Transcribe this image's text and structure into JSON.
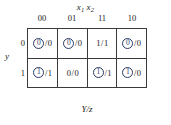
{
  "figure": {
    "top_input_label": "x1x2",
    "top_input_base": "x",
    "top_input_sub1": "1",
    "top_input_sub2": "2",
    "row_state_label": "y",
    "bottom_output_label": "Y/z",
    "slash": "/",
    "circle_color": "#2b3a66",
    "line_color": "#3a3a3a"
  },
  "chart_data": {
    "type": "table",
    "xlabel": "x1x2",
    "ylabel": "y",
    "footer_label": "Y/z",
    "column_headers": [
      "00",
      "01",
      "11",
      "10"
    ],
    "row_headers": [
      "0",
      "1"
    ],
    "cells": [
      [
        {
          "next_state": "0",
          "output": "0",
          "stable": true
        },
        {
          "next_state": "0",
          "output": "0",
          "stable": true
        },
        {
          "next_state": "1",
          "output": "1",
          "stable": false
        },
        {
          "next_state": "0",
          "output": "0",
          "stable": true
        }
      ],
      [
        {
          "next_state": "1",
          "output": "1",
          "stable": true
        },
        {
          "next_state": "0",
          "output": "0",
          "stable": false
        },
        {
          "next_state": "1",
          "output": "1",
          "stable": true
        },
        {
          "next_state": "1",
          "output": "0",
          "stable": true
        }
      ]
    ]
  }
}
